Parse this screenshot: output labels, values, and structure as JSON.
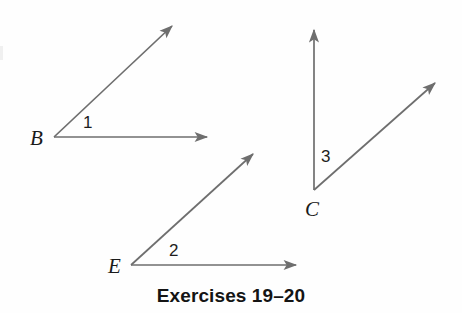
{
  "figure": {
    "caption": "Exercises 19–20",
    "background_color": "#fefefe",
    "ray_color": "#6e6e6e",
    "label_color": "#1a1a1a",
    "width": 462,
    "height": 313
  },
  "angles": [
    {
      "vertex_label": "B",
      "number_label": "1",
      "vertex": {
        "x": 54,
        "y": 137
      },
      "vertex_label_pos": {
        "x": 30,
        "y": 128
      },
      "number_label_pos": {
        "x": 83,
        "y": 114
      },
      "rays": [
        {
          "name": "ray-b-diagonal",
          "tip": {
            "x": 176,
            "y": 22
          }
        },
        {
          "name": "ray-b-horizontal",
          "tip": {
            "x": 217,
            "y": 137
          }
        }
      ]
    },
    {
      "vertex_label": "E",
      "number_label": "2",
      "vertex": {
        "x": 131,
        "y": 265
      },
      "vertex_label_pos": {
        "x": 108,
        "y": 256
      },
      "number_label_pos": {
        "x": 169,
        "y": 242
      },
      "rays": [
        {
          "name": "ray-e-diagonal",
          "tip": {
            "x": 257,
            "y": 150
          }
        },
        {
          "name": "ray-e-horizontal",
          "tip": {
            "x": 306,
            "y": 265
          }
        }
      ]
    },
    {
      "vertex_label": "C",
      "number_label": "3",
      "vertex": {
        "x": 314,
        "y": 190
      },
      "vertex_label_pos": {
        "x": 305,
        "y": 199
      },
      "number_label_pos": {
        "x": 321,
        "y": 148
      },
      "rays": [
        {
          "name": "ray-c-vertical",
          "tip": {
            "x": 314,
            "y": 20
          }
        },
        {
          "name": "ray-c-diagonal",
          "tip": {
            "x": 440,
            "y": 78
          }
        }
      ]
    }
  ]
}
